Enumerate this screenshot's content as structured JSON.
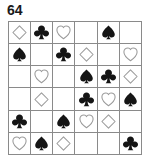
{
  "puzzle": {
    "label": "64",
    "rows": 6,
    "cols": 6,
    "symbol_glyphs": {
      "diamond": "♢",
      "club": "♣",
      "heart": "♡",
      "spade": "♠",
      "empty": ""
    },
    "colors": {
      "filled": "#151515",
      "outline_stroke": "#9a9a9a",
      "gridline": "#8a8a8a",
      "background": "#ffffff",
      "label_text": "#1a1a1a"
    },
    "grid": [
      [
        {
          "symbol": "diamond",
          "style": "outline"
        },
        {
          "symbol": "club",
          "style": "filled"
        },
        {
          "symbol": "heart",
          "style": "outline"
        },
        {
          "symbol": "empty",
          "style": "none"
        },
        {
          "symbol": "spade",
          "style": "filled"
        },
        {
          "symbol": "empty",
          "style": "none"
        }
      ],
      [
        {
          "symbol": "spade",
          "style": "filled"
        },
        {
          "symbol": "empty",
          "style": "none"
        },
        {
          "symbol": "club",
          "style": "filled"
        },
        {
          "symbol": "diamond",
          "style": "outline"
        },
        {
          "symbol": "empty",
          "style": "none"
        },
        {
          "symbol": "heart",
          "style": "outline"
        }
      ],
      [
        {
          "symbol": "empty",
          "style": "none"
        },
        {
          "symbol": "heart",
          "style": "outline"
        },
        {
          "symbol": "empty",
          "style": "none"
        },
        {
          "symbol": "spade",
          "style": "filled"
        },
        {
          "symbol": "club",
          "style": "filled"
        },
        {
          "symbol": "diamond",
          "style": "outline"
        }
      ],
      [
        {
          "symbol": "empty",
          "style": "none"
        },
        {
          "symbol": "diamond",
          "style": "outline"
        },
        {
          "symbol": "empty",
          "style": "none"
        },
        {
          "symbol": "club",
          "style": "filled"
        },
        {
          "symbol": "heart",
          "style": "outline"
        },
        {
          "symbol": "spade",
          "style": "filled"
        }
      ],
      [
        {
          "symbol": "club",
          "style": "filled"
        },
        {
          "symbol": "empty",
          "style": "none"
        },
        {
          "symbol": "spade",
          "style": "filled"
        },
        {
          "symbol": "heart",
          "style": "outline"
        },
        {
          "symbol": "diamond",
          "style": "outline"
        },
        {
          "symbol": "empty",
          "style": "none"
        }
      ],
      [
        {
          "symbol": "heart",
          "style": "outline"
        },
        {
          "symbol": "spade",
          "style": "filled"
        },
        {
          "symbol": "diamond",
          "style": "outline"
        },
        {
          "symbol": "empty",
          "style": "none"
        },
        {
          "symbol": "empty",
          "style": "none"
        },
        {
          "symbol": "club",
          "style": "filled"
        }
      ]
    ]
  }
}
